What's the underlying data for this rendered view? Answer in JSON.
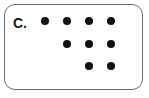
{
  "card": {
    "option_label": "C.",
    "border_color": "#6c6c6c",
    "background_color": "#ffffff",
    "corner_radius_px": 11
  },
  "dot_style": {
    "color": "#111111",
    "diameter_px": 8,
    "shape": "filled-circle"
  },
  "grid": {
    "columns": 4,
    "rows": 3,
    "column_x_px": [
      40,
      62,
      84,
      106
    ],
    "row_y_px": [
      16,
      39,
      61
    ],
    "column_spacing_px": 22,
    "row_spacing_px": 22,
    "description": "Right-aligned staircase: row 1 has 4 dots, row 2 has 3 dots, row 3 has 2 dots",
    "dot_counts_per_row": [
      4,
      3,
      2
    ],
    "total_dots": 9
  },
  "dots": [
    {
      "name": "dot-r1-c1",
      "row": 1,
      "col": 1,
      "x": 40,
      "y": 16
    },
    {
      "name": "dot-r1-c2",
      "row": 1,
      "col": 2,
      "x": 62,
      "y": 16
    },
    {
      "name": "dot-r1-c3",
      "row": 1,
      "col": 3,
      "x": 84,
      "y": 16
    },
    {
      "name": "dot-r1-c4",
      "row": 1,
      "col": 4,
      "x": 106,
      "y": 16
    },
    {
      "name": "dot-r2-c2",
      "row": 2,
      "col": 2,
      "x": 62,
      "y": 39
    },
    {
      "name": "dot-r2-c3",
      "row": 2,
      "col": 3,
      "x": 84,
      "y": 39
    },
    {
      "name": "dot-r2-c4",
      "row": 2,
      "col": 4,
      "x": 106,
      "y": 39
    },
    {
      "name": "dot-r3-c3",
      "row": 3,
      "col": 3,
      "x": 84,
      "y": 61
    },
    {
      "name": "dot-r3-c4",
      "row": 3,
      "col": 4,
      "x": 106,
      "y": 61
    }
  ]
}
